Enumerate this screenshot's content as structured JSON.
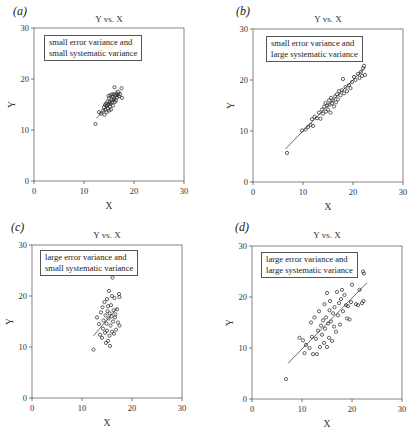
{
  "chart_data": [
    {
      "panel": "a",
      "type": "scatter",
      "label": "(a)",
      "title": "Y vs. X",
      "annotation": [
        "small error variance and",
        "small systematic variance"
      ],
      "xlabel": "X",
      "ylabel": "Y",
      "xlim": [
        0,
        30
      ],
      "ylim": [
        0,
        30
      ],
      "xticks": [
        0,
        10,
        20,
        30
      ],
      "yticks": [
        0,
        10,
        20,
        30
      ],
      "grid": false,
      "trendline": {
        "x": [
          12.5,
          17.5
        ],
        "y": [
          12.3,
          17.6
        ]
      },
      "points": [
        [
          12.3,
          11.2
        ],
        [
          13.0,
          13.5
        ],
        [
          13.4,
          13.2
        ],
        [
          13.8,
          13.8
        ],
        [
          14.0,
          14.5
        ],
        [
          14.1,
          13.0
        ],
        [
          14.3,
          14.0
        ],
        [
          14.4,
          15.2
        ],
        [
          14.5,
          13.5
        ],
        [
          14.6,
          14.8
        ],
        [
          14.7,
          15.6
        ],
        [
          14.8,
          14.2
        ],
        [
          14.9,
          15.0
        ],
        [
          15.0,
          16.2
        ],
        [
          15.0,
          13.8
        ],
        [
          15.1,
          15.5
        ],
        [
          15.2,
          14.6
        ],
        [
          15.3,
          16.8
        ],
        [
          15.3,
          15.2
        ],
        [
          15.4,
          14.0
        ],
        [
          15.5,
          16.0
        ],
        [
          15.6,
          15.4
        ],
        [
          15.7,
          16.5
        ],
        [
          15.8,
          14.8
        ],
        [
          15.9,
          15.9
        ],
        [
          16.0,
          17.0
        ],
        [
          16.0,
          16.2
        ],
        [
          16.1,
          18.4
        ],
        [
          16.2,
          15.5
        ],
        [
          16.3,
          16.8
        ],
        [
          16.4,
          15.8
        ],
        [
          16.5,
          17.2
        ],
        [
          16.6,
          16.4
        ],
        [
          16.8,
          17.5
        ],
        [
          17.0,
          16.6
        ],
        [
          17.2,
          17.0
        ],
        [
          17.5,
          18.2
        ],
        [
          17.6,
          16.3
        ],
        [
          14.2,
          14.9
        ],
        [
          15.6,
          17.0
        ],
        [
          16.7,
          16.9
        ],
        [
          14.9,
          16.7
        ]
      ]
    },
    {
      "panel": "b",
      "type": "scatter",
      "label": "(b)",
      "title": "Y vs. X",
      "annotation": [
        "small error variance and",
        "large systematic variance"
      ],
      "xlabel": "X",
      "ylabel": "Y",
      "xlim": [
        0,
        30
      ],
      "ylim": [
        0,
        30
      ],
      "xticks": [
        0,
        10,
        20,
        30
      ],
      "yticks": [
        0,
        10,
        20,
        30
      ],
      "grid": false,
      "trendline": {
        "x": [
          6.5,
          22.5
        ],
        "y": [
          6.5,
          22.5
        ]
      },
      "points": [
        [
          6.8,
          5.7
        ],
        [
          9.8,
          10.1
        ],
        [
          10.5,
          10.3
        ],
        [
          11.0,
          10.8
        ],
        [
          11.5,
          11.2
        ],
        [
          11.8,
          12.3
        ],
        [
          12.0,
          11.0
        ],
        [
          12.3,
          12.8
        ],
        [
          12.8,
          12.5
        ],
        [
          13.2,
          13.6
        ],
        [
          13.5,
          12.4
        ],
        [
          13.8,
          14.2
        ],
        [
          14.0,
          13.4
        ],
        [
          14.2,
          14.8
        ],
        [
          14.5,
          15.5
        ],
        [
          14.6,
          13.8
        ],
        [
          14.8,
          15.0
        ],
        [
          15.0,
          14.2
        ],
        [
          15.2,
          16.0
        ],
        [
          15.3,
          15.2
        ],
        [
          15.5,
          13.6
        ],
        [
          15.6,
          16.5
        ],
        [
          15.8,
          15.4
        ],
        [
          16.0,
          16.0
        ],
        [
          16.2,
          14.8
        ],
        [
          16.4,
          16.8
        ],
        [
          16.6,
          15.6
        ],
        [
          16.8,
          17.2
        ],
        [
          17.0,
          16.2
        ],
        [
          17.2,
          17.8
        ],
        [
          17.5,
          17.0
        ],
        [
          17.8,
          18.0
        ],
        [
          18.0,
          20.2
        ],
        [
          18.2,
          17.4
        ],
        [
          18.5,
          18.6
        ],
        [
          18.8,
          17.8
        ],
        [
          19.2,
          19.0
        ],
        [
          19.5,
          18.4
        ],
        [
          19.8,
          19.6
        ],
        [
          20.2,
          20.6
        ],
        [
          20.5,
          20.0
        ],
        [
          21.0,
          21.2
        ],
        [
          21.3,
          20.4
        ],
        [
          21.6,
          21.6
        ],
        [
          22.0,
          22.3
        ],
        [
          22.2,
          22.8
        ],
        [
          22.4,
          21.0
        ],
        [
          21.8,
          20.8
        ]
      ]
    },
    {
      "panel": "c",
      "type": "scatter",
      "label": "(c)",
      "title": "Y vs. X",
      "annotation": [
        "large error variance and",
        "small systematic variance"
      ],
      "xlabel": "X",
      "ylabel": "Y",
      "xlim": [
        0,
        30
      ],
      "ylim": [
        0,
        30
      ],
      "xticks": [
        0,
        10,
        20,
        30
      ],
      "yticks": [
        0,
        10,
        20,
        30
      ],
      "grid": false,
      "trendline": {
        "x": [
          12.3,
          17.0
        ],
        "y": [
          12.2,
          17.6
        ]
      },
      "points": [
        [
          12.3,
          9.5
        ],
        [
          13.0,
          15.8
        ],
        [
          13.4,
          14.5
        ],
        [
          13.6,
          12.4
        ],
        [
          13.8,
          16.8
        ],
        [
          14.0,
          11.8
        ],
        [
          14.1,
          17.8
        ],
        [
          14.2,
          13.6
        ],
        [
          14.3,
          15.2
        ],
        [
          14.5,
          18.8
        ],
        [
          14.6,
          12.8
        ],
        [
          14.7,
          16.2
        ],
        [
          14.8,
          10.8
        ],
        [
          14.9,
          14.6
        ],
        [
          15.0,
          19.4
        ],
        [
          15.0,
          13.2
        ],
        [
          15.1,
          17.0
        ],
        [
          15.2,
          11.2
        ],
        [
          15.3,
          15.6
        ],
        [
          15.4,
          21.0
        ],
        [
          15.5,
          12.2
        ],
        [
          15.5,
          16.6
        ],
        [
          15.6,
          10.2
        ],
        [
          15.7,
          14.2
        ],
        [
          15.8,
          18.2
        ],
        [
          15.9,
          16.0
        ],
        [
          16.0,
          20.0
        ],
        [
          16.0,
          13.0
        ],
        [
          16.1,
          23.6
        ],
        [
          16.2,
          15.0
        ],
        [
          16.3,
          17.2
        ],
        [
          16.4,
          12.6
        ],
        [
          16.5,
          19.6
        ],
        [
          16.6,
          15.8
        ],
        [
          16.8,
          13.4
        ],
        [
          17.0,
          17.4
        ],
        [
          17.2,
          14.8
        ],
        [
          17.4,
          20.4
        ],
        [
          17.5,
          14.2
        ],
        [
          17.5,
          19.8
        ],
        [
          16.7,
          16.4
        ],
        [
          15.2,
          18.0
        ]
      ]
    },
    {
      "panel": "d",
      "type": "scatter",
      "label": "(d)",
      "title": "Y vs. X",
      "annotation": [
        "large error variance and",
        "large systematic variance"
      ],
      "xlabel": "X",
      "ylabel": "Y",
      "xlim": [
        0,
        30
      ],
      "ylim": [
        0,
        30
      ],
      "xticks": [
        0,
        10,
        20,
        30
      ],
      "yticks": [
        0,
        10,
        20,
        30
      ],
      "grid": false,
      "trendline": {
        "x": [
          7.2,
          23.0
        ],
        "y": [
          7.0,
          22.8
        ]
      },
      "points": [
        [
          6.8,
          3.9
        ],
        [
          9.5,
          12.0
        ],
        [
          10.2,
          11.5
        ],
        [
          10.5,
          9.0
        ],
        [
          10.8,
          10.6
        ],
        [
          11.5,
          10.0
        ],
        [
          11.8,
          15.0
        ],
        [
          12.0,
          12.2
        ],
        [
          12.2,
          8.8
        ],
        [
          12.5,
          16.0
        ],
        [
          12.8,
          11.8
        ],
        [
          13.0,
          8.8
        ],
        [
          13.2,
          13.4
        ],
        [
          13.4,
          17.2
        ],
        [
          13.6,
          10.2
        ],
        [
          13.8,
          14.4
        ],
        [
          14.0,
          12.6
        ],
        [
          14.2,
          15.4
        ],
        [
          14.4,
          11.0
        ],
        [
          14.5,
          18.6
        ],
        [
          14.6,
          13.8
        ],
        [
          14.8,
          16.0
        ],
        [
          15.0,
          20.8
        ],
        [
          15.0,
          10.2
        ],
        [
          15.2,
          14.8
        ],
        [
          15.4,
          12.0
        ],
        [
          15.5,
          17.4
        ],
        [
          15.6,
          19.2
        ],
        [
          15.8,
          15.2
        ],
        [
          16.0,
          11.4
        ],
        [
          16.2,
          16.8
        ],
        [
          16.4,
          14.2
        ],
        [
          16.5,
          18.0
        ],
        [
          16.8,
          13.2
        ],
        [
          17.0,
          21.0
        ],
        [
          17.2,
          16.4
        ],
        [
          17.4,
          18.8
        ],
        [
          17.6,
          14.6
        ],
        [
          17.8,
          19.6
        ],
        [
          18.0,
          21.4
        ],
        [
          18.2,
          17.2
        ],
        [
          18.5,
          20.4
        ],
        [
          18.8,
          18.4
        ],
        [
          19.0,
          15.8
        ],
        [
          19.2,
          18.2
        ],
        [
          19.5,
          15.6
        ],
        [
          19.8,
          19.0
        ],
        [
          20.0,
          22.4
        ],
        [
          20.8,
          18.6
        ],
        [
          21.2,
          18.4
        ],
        [
          21.5,
          21.4
        ],
        [
          22.0,
          18.8
        ],
        [
          22.2,
          25.0
        ],
        [
          22.3,
          19.2
        ],
        [
          22.4,
          24.6
        ]
      ]
    }
  ]
}
